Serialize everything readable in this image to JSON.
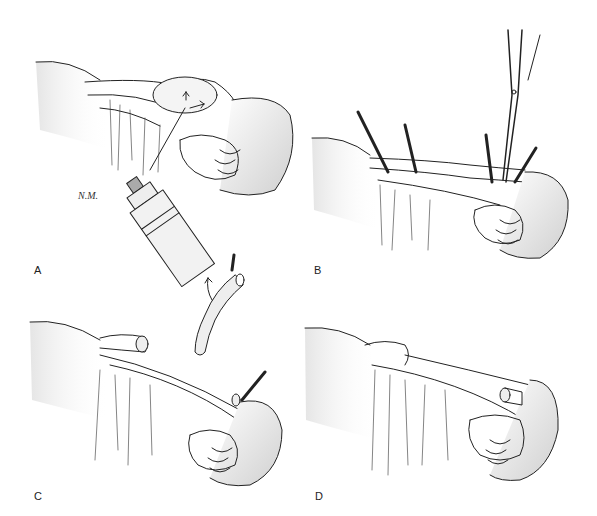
{
  "figure": {
    "panels": [
      {
        "id": "A",
        "label": "A",
        "description": "Injection into mass on tubal serosa with syringe; arrows indicate fluid dissection",
        "signature": "N.M."
      },
      {
        "id": "B",
        "label": "B",
        "description": "Tube clamped with multiple hemostats; scissors dividing near uterine cornu"
      },
      {
        "id": "C",
        "label": "C",
        "description": "Tubal segment removed (arrow indicates lifting); proximal and distal stumps ligated"
      },
      {
        "id": "D",
        "label": "D",
        "description": "Completed procedure with ligated stumps"
      }
    ],
    "colors": {
      "ink": "#222222",
      "shade": "#d8d8d8",
      "background": "#ffffff"
    }
  }
}
